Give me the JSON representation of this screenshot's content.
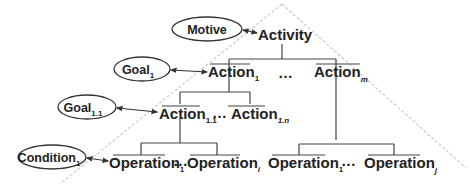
{
  "diagram": {
    "colors": {
      "line": "#444444",
      "text": "#222222",
      "triangle": "#cfcfcf",
      "background": "#ffffff"
    },
    "ellipses": {
      "motive": {
        "label": "Motive",
        "sub": ""
      },
      "goal1": {
        "label": "Goal",
        "sub": "1"
      },
      "goal11": {
        "label": "Goal",
        "sub": "1.1"
      },
      "condition1": {
        "label": "Condition",
        "sub": "1"
      }
    },
    "nodes": {
      "activity": {
        "label": "Activity"
      },
      "action1": {
        "label": "Action",
        "sub": "1"
      },
      "actionm": {
        "label": "Action",
        "sub": "m"
      },
      "action11": {
        "label": "Action",
        "sub": "1.1"
      },
      "action1n": {
        "label": "Action",
        "sub": "1.n"
      },
      "op1_left": {
        "label": "Operation",
        "sub": "1"
      },
      "opi": {
        "label": "Operation",
        "sub": "i"
      },
      "op1_right": {
        "label": "Operation",
        "sub": "1"
      },
      "opj": {
        "label": "Operation",
        "sub": "j"
      }
    },
    "ellipsis": "…"
  }
}
